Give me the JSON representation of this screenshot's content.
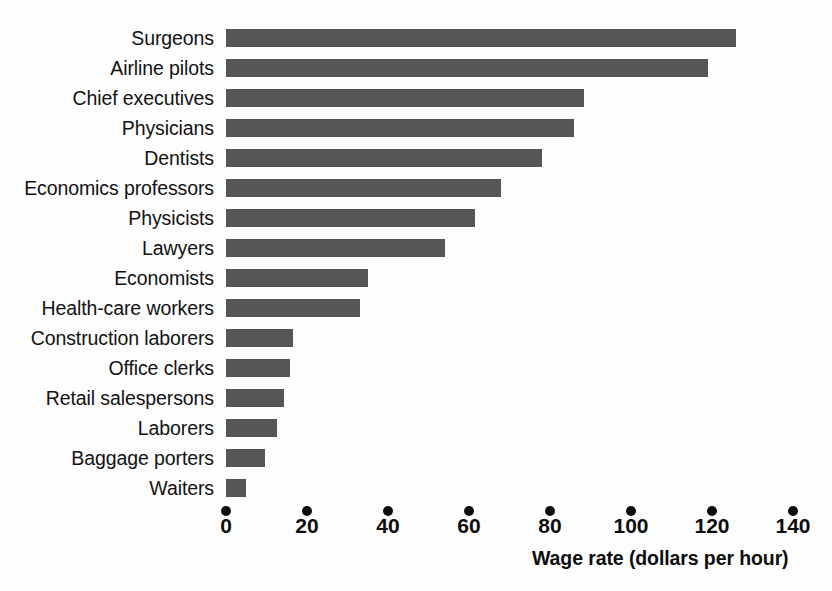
{
  "chart_data": {
    "type": "bar",
    "orientation": "horizontal",
    "title": "",
    "subtitle": "",
    "xlabel": "Wage rate (dollars per hour)",
    "ylabel": "",
    "xlim": [
      0,
      140
    ],
    "xticks": [
      0,
      20,
      40,
      60,
      80,
      100,
      120,
      140
    ],
    "xtick_labels": [
      "0",
      "20",
      "40",
      "60",
      "80",
      "100",
      "120",
      "140"
    ],
    "grid": false,
    "legend": null,
    "bar_color": "#565656",
    "categories": [
      "Surgeons",
      "Airline pilots",
      "Chief executives",
      "Physicians",
      "Dentists",
      "Economics professors",
      "Physicists",
      "Lawyers",
      "Economists",
      "Health-care workers",
      "Construction laborers",
      "Office clerks",
      "Retail salespersons",
      "Laborers",
      "Baggage porters",
      "Waiters"
    ],
    "values": [
      126,
      119,
      88.5,
      86,
      78,
      68,
      61.5,
      54,
      35,
      33,
      16.5,
      15.8,
      14.3,
      12.6,
      9.6,
      4.9
    ]
  },
  "axis": {
    "title": "Wage rate (dollars per hour)"
  }
}
